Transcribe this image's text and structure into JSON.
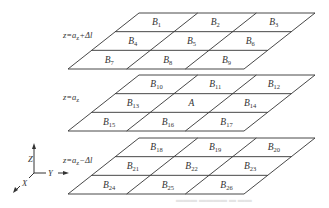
{
  "diagram": {
    "planes": [
      {
        "label": "z=a_z+Δl",
        "label_parts": {
          "prefix": "z=a",
          "sub": "z",
          "suffix": "+Δl"
        },
        "cells": [
          [
            "B1",
            "B2",
            "B3"
          ],
          [
            "B4",
            "B5",
            "B6"
          ],
          [
            "B7",
            "B8",
            "B9"
          ]
        ]
      },
      {
        "label": "z=a_z",
        "label_parts": {
          "prefix": "z=a",
          "sub": "z",
          "suffix": ""
        },
        "cells": [
          [
            "B10",
            "B11",
            "B12"
          ],
          [
            "B13",
            "A",
            "B14"
          ],
          [
            "B15",
            "B16",
            "B17"
          ]
        ]
      },
      {
        "label": "z=a_z−Δl",
        "label_parts": {
          "prefix": "z=a",
          "sub": "z",
          "suffix": "−Δl"
        },
        "cells": [
          [
            "B18",
            "B19",
            "B20"
          ],
          [
            "B21",
            "B22",
            "B23"
          ],
          [
            "B24",
            "B25",
            "B26"
          ]
        ]
      }
    ],
    "axes": {
      "z": "Z",
      "y": "Y",
      "x": "X"
    },
    "caption": "▬▬▬ ▬▬▬▬ ▬ ▬▬"
  }
}
